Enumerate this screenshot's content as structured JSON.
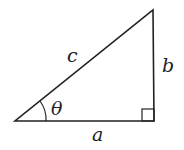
{
  "diagram": {
    "type": "right-triangle",
    "labels": {
      "hypotenuse": "c",
      "opposite": "b",
      "adjacent": "a",
      "angle": "θ"
    },
    "stroke_color": "#222222"
  }
}
